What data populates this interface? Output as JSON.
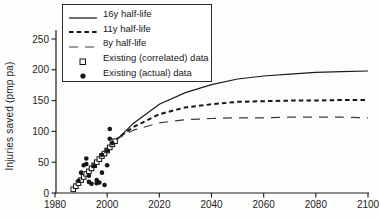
{
  "figure": {
    "type": "scientific-line-chart",
    "background": "#ffffff",
    "ink_color": "#1b1b1b"
  },
  "chart_data": {
    "type": "line",
    "title": "",
    "xlabel": "",
    "ylabel": "Injuries saved (pmp pa)",
    "xlim": [
      1980,
      2100
    ],
    "ylim": [
      0,
      250
    ],
    "x_ticks": [
      "1980",
      "2000",
      "2020",
      "2040",
      "2060",
      "2080",
      "2100"
    ],
    "x_tick_values": [
      1980,
      2000,
      2020,
      2040,
      2060,
      2080,
      2100
    ],
    "y_ticks": [
      "0",
      "50",
      "100",
      "150",
      "200",
      "250"
    ],
    "y_tick_values": [
      0,
      50,
      100,
      150,
      200,
      250
    ],
    "grid": false,
    "legend_position": "top-left",
    "series": [
      {
        "name": "16y half-life",
        "kind": "line",
        "style": "solid",
        "x": [
          2003,
          2006,
          2010,
          2020,
          2030,
          2040,
          2050,
          2060,
          2070,
          2080,
          2090,
          2100
        ],
        "y": [
          85,
          96,
          113,
          144,
          163,
          176,
          185,
          190,
          193,
          196,
          197,
          198
        ]
      },
      {
        "name": "11y half-life",
        "kind": "line",
        "style": "dash-short",
        "x": [
          2003,
          2006,
          2010,
          2020,
          2030,
          2040,
          2050,
          2060,
          2070,
          2080,
          2090,
          2100
        ],
        "y": [
          85,
          95,
          107,
          128,
          139,
          144,
          148,
          149,
          150,
          150,
          151,
          151
        ]
      },
      {
        "name": "8y half-life",
        "kind": "line",
        "style": "dash-long",
        "x": [
          2003,
          2006,
          2010,
          2020,
          2030,
          2040,
          2050,
          2060,
          2070,
          2080,
          2090,
          2100
        ],
        "y": [
          85,
          93,
          102,
          114,
          119,
          121,
          122,
          122,
          123,
          123,
          123,
          122
        ]
      },
      {
        "name": "Existing (correlated) data",
        "kind": "scatter",
        "style": "open-square",
        "x": [
          1987,
          1988,
          1989,
          1990,
          1991,
          1992,
          1993,
          1994,
          1995,
          1996,
          1997,
          1998,
          1999,
          2000,
          2001,
          2002,
          2003
        ],
        "y": [
          6,
          11,
          16,
          21,
          26,
          31,
          35,
          40,
          45,
          50,
          55,
          60,
          64,
          69,
          74,
          79,
          84
        ]
      },
      {
        "name": "Existing (actual) data",
        "kind": "scatter",
        "style": "filled-circle",
        "x": [
          1989,
          1990,
          1991,
          1992,
          1992,
          1993,
          1993,
          1994,
          1995,
          1996,
          1996,
          1997,
          1998,
          1998,
          1999,
          2000,
          2000,
          2001,
          2001,
          2002
        ],
        "y": [
          20,
          33,
          45,
          56,
          47,
          28,
          18,
          15,
          44,
          21,
          16,
          17,
          33,
          62,
          13,
          45,
          69,
          88,
          104,
          81
        ]
      }
    ]
  }
}
